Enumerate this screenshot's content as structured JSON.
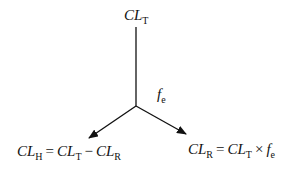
{
  "diagram": {
    "top_node": {
      "base": "CL",
      "sub": "T"
    },
    "edge_label": {
      "base": "f",
      "sub": "e"
    },
    "left_node": {
      "lhs_base": "CL",
      "lhs_sub": "H",
      "eq": "=",
      "t1_base": "CL",
      "t1_sub": "T",
      "op": "−",
      "t2_base": "CL",
      "t2_sub": "R"
    },
    "right_node": {
      "lhs_base": "CL",
      "lhs_sub": "R",
      "eq": "=",
      "t1_base": "CL",
      "t1_sub": "T",
      "op": "×",
      "t2_base": "f",
      "t2_sub": "e"
    },
    "colors": {
      "line": "#111111",
      "text": "#111111",
      "background": "#ffffff"
    }
  }
}
